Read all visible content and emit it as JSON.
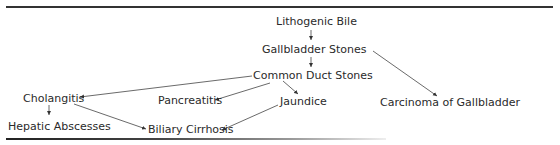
{
  "diagram": {
    "nodes": {
      "lithogenic_bile": "Lithogenic Bile",
      "gallbladder_stones": "Gallbladder Stones",
      "common_duct_stones": "Common Duct Stones",
      "cholangitis": "Cholangitis",
      "pancreatitis": "Pancreatitis",
      "jaundice": "Jaundice",
      "carcinoma": "Carcinoma of Gallbladder",
      "hepatic_abscesses": "Hepatic Abscesses",
      "biliary_cirrhosis": "Biliary Cirrhosis"
    },
    "edges": [
      {
        "from": "Lithogenic Bile",
        "to": "Gallbladder Stones"
      },
      {
        "from": "Gallbladder Stones",
        "to": "Common Duct Stones"
      },
      {
        "from": "Gallbladder Stones",
        "to": "Carcinoma of Gallbladder"
      },
      {
        "from": "Common Duct Stones",
        "to": "Cholangitis"
      },
      {
        "from": "Common Duct Stones",
        "to": "Pancreatitis"
      },
      {
        "from": "Common Duct Stones",
        "to": "Jaundice"
      },
      {
        "from": "Jaundice",
        "to": "Biliary Cirrhosis"
      },
      {
        "from": "Cholangitis",
        "to": "Biliary Cirrhosis"
      },
      {
        "from": "Cholangitis",
        "to": "Hepatic Abscesses"
      }
    ],
    "colors": {
      "text": "#2a2a2a",
      "line": "#333333"
    }
  }
}
